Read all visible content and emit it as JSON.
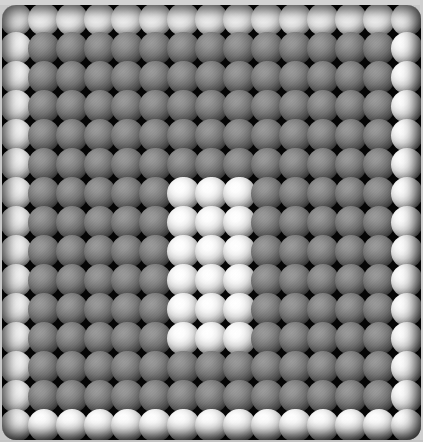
{
  "view": {
    "title": "Sphere Lattice Matrix",
    "background_color": "#c8c8c8",
    "panel_color": "#050505",
    "panel_corner_radius": "14px"
  },
  "palette": {
    "bright_highlight": "#ffffff",
    "bright_midtone": "#b4b4b4",
    "dim_highlight": "#9a9a9a",
    "dim_midtone": "#5c5c5c",
    "shadow": "#050505"
  },
  "chart_data": {
    "type": "heatmap",
    "subtitle": "15 x 15 shaded-sphere array with bright border ring and bright 3x6 central block",
    "xlabel": "",
    "ylabel": "",
    "grid": false,
    "legend_position": "none",
    "rows": 15,
    "cols": 15,
    "value_labels": {
      "0": "dim",
      "1": "bright"
    },
    "annotations": [
      "Outer ring (row 0, row 14, col 0, col 14) is fully bright",
      "Interior spheres are dim / low intensity",
      "Bright rectangular block occupies columns 6-8 and rows 6-11"
    ],
    "values": [
      [
        1,
        1,
        1,
        1,
        1,
        1,
        1,
        1,
        1,
        1,
        1,
        1,
        1,
        1,
        1
      ],
      [
        1,
        0,
        0,
        0,
        0,
        0,
        0,
        0,
        0,
        0,
        0,
        0,
        0,
        0,
        1
      ],
      [
        1,
        0,
        0,
        0,
        0,
        0,
        0,
        0,
        0,
        0,
        0,
        0,
        0,
        0,
        1
      ],
      [
        1,
        0,
        0,
        0,
        0,
        0,
        0,
        0,
        0,
        0,
        0,
        0,
        0,
        0,
        1
      ],
      [
        1,
        0,
        0,
        0,
        0,
        0,
        0,
        0,
        0,
        0,
        0,
        0,
        0,
        0,
        1
      ],
      [
        1,
        0,
        0,
        0,
        0,
        0,
        0,
        0,
        0,
        0,
        0,
        0,
        0,
        0,
        1
      ],
      [
        1,
        0,
        0,
        0,
        0,
        0,
        1,
        1,
        1,
        0,
        0,
        0,
        0,
        0,
        1
      ],
      [
        1,
        0,
        0,
        0,
        0,
        0,
        1,
        1,
        1,
        0,
        0,
        0,
        0,
        0,
        1
      ],
      [
        1,
        0,
        0,
        0,
        0,
        0,
        1,
        1,
        1,
        0,
        0,
        0,
        0,
        0,
        1
      ],
      [
        1,
        0,
        0,
        0,
        0,
        0,
        1,
        1,
        1,
        0,
        0,
        0,
        0,
        0,
        1
      ],
      [
        1,
        0,
        0,
        0,
        0,
        0,
        1,
        1,
        1,
        0,
        0,
        0,
        0,
        0,
        1
      ],
      [
        1,
        0,
        0,
        0,
        0,
        0,
        1,
        1,
        1,
        0,
        0,
        0,
        0,
        0,
        1
      ],
      [
        1,
        0,
        0,
        0,
        0,
        0,
        0,
        0,
        0,
        0,
        0,
        0,
        0,
        0,
        1
      ],
      [
        1,
        0,
        0,
        0,
        0,
        0,
        0,
        0,
        0,
        0,
        0,
        0,
        0,
        0,
        1
      ],
      [
        1,
        1,
        1,
        1,
        1,
        1,
        1,
        1,
        1,
        1,
        1,
        1,
        1,
        1,
        1
      ]
    ]
  }
}
